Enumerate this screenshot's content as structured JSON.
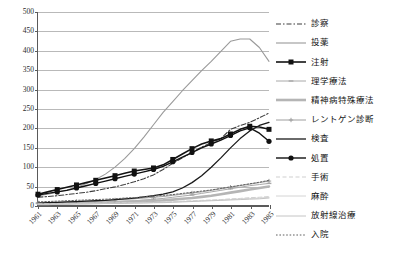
{
  "chart_data": {
    "type": "line",
    "title": "",
    "xlabel": "",
    "ylabel": "",
    "ylim": [
      0,
      500
    ],
    "ytick_step": 50,
    "grid": true,
    "legend_position": "right",
    "x": [
      1961,
      1962,
      1963,
      1964,
      1965,
      1966,
      1967,
      1968,
      1969,
      1970,
      1971,
      1972,
      1973,
      1974,
      1975,
      1976,
      1977,
      1978,
      1979,
      1980,
      1981,
      1982,
      1983,
      1984,
      1985
    ],
    "tick_labels": [
      "1961",
      "1963",
      "1965",
      "1967",
      "1969",
      "1971",
      "1973",
      "1975",
      "1977",
      "1979",
      "1981",
      "1983",
      "1985"
    ],
    "ytick_labels": [
      "0",
      "50",
      "100",
      "150",
      "200",
      "250",
      "300",
      "350",
      "400",
      "450",
      "500"
    ],
    "series": [
      {
        "name": "診察",
        "color": "#3d3d3d",
        "style": "dash-dot",
        "marker": "none",
        "width": 1.1,
        "values": [
          20,
          22,
          24,
          27,
          30,
          33,
          37,
          42,
          47,
          53,
          60,
          68,
          78,
          92,
          108,
          122,
          136,
          150,
          162,
          172,
          196,
          206,
          214,
          226,
          238
        ]
      },
      {
        "name": "投薬",
        "color": "#9a9a9a",
        "style": "solid",
        "marker": "none",
        "width": 1.1,
        "values": [
          24,
          28,
          33,
          39,
          46,
          55,
          66,
          80,
          98,
          120,
          146,
          176,
          208,
          240,
          268,
          296,
          322,
          348,
          372,
          398,
          424,
          430,
          430,
          408,
          372
        ]
      },
      {
        "name": "注射",
        "color": "#121212",
        "style": "solid",
        "marker": "square",
        "width": 1.6,
        "values": [
          28,
          34,
          40,
          46,
          52,
          58,
          64,
          70,
          76,
          82,
          88,
          92,
          96,
          104,
          118,
          132,
          146,
          158,
          166,
          172,
          184,
          196,
          204,
          202,
          196
        ]
      },
      {
        "name": "理学療法",
        "color": "#a8a8a8",
        "style": "solid",
        "marker": "dash",
        "width": 1.0,
        "values": [
          4,
          4,
          5,
          5,
          6,
          6,
          7,
          8,
          9,
          10,
          11,
          13,
          15,
          17,
          20,
          23,
          26,
          30,
          34,
          38,
          42,
          46,
          50,
          53,
          56
        ]
      },
      {
        "name": "精神病特殊療法",
        "color": "#b5b5b5",
        "style": "solid-thick",
        "marker": "none",
        "width": 2.6,
        "values": [
          3,
          3,
          4,
          4,
          5,
          5,
          6,
          6,
          7,
          8,
          9,
          10,
          11,
          12,
          14,
          16,
          18,
          21,
          24,
          28,
          32,
          36,
          40,
          44,
          48
        ]
      },
      {
        "name": "レントゲン診断",
        "color": "#9e9e9e",
        "style": "solid",
        "marker": "cross",
        "width": 1.0,
        "values": [
          6,
          6,
          7,
          8,
          9,
          10,
          11,
          12,
          13,
          15,
          16,
          18,
          20,
          22,
          25,
          28,
          31,
          34,
          38,
          42,
          46,
          50,
          54,
          58,
          62
        ]
      },
      {
        "name": "検査",
        "color": "#1a1a1a",
        "style": "solid",
        "marker": "none",
        "width": 1.3,
        "values": [
          5,
          6,
          7,
          8,
          9,
          10,
          11,
          12,
          14,
          16,
          18,
          21,
          24,
          28,
          34,
          44,
          58,
          76,
          98,
          122,
          148,
          172,
          192,
          206,
          214
        ]
      },
      {
        "name": "処置",
        "color": "#111111",
        "style": "solid",
        "marker": "circle",
        "width": 1.4,
        "values": [
          26,
          30,
          34,
          38,
          44,
          50,
          56,
          62,
          68,
          74,
          80,
          86,
          92,
          100,
          112,
          124,
          136,
          148,
          158,
          168,
          180,
          192,
          200,
          186,
          165
        ]
      },
      {
        "name": "手術",
        "color": "#cfcfcf",
        "style": "dashed",
        "marker": "none",
        "width": 1.0,
        "values": [
          3,
          3,
          3,
          4,
          4,
          4,
          5,
          5,
          5,
          6,
          6,
          7,
          7,
          8,
          9,
          10,
          11,
          12,
          13,
          14,
          16,
          17,
          19,
          20,
          22
        ]
      },
      {
        "name": "麻酔",
        "color": "#d4d4d4",
        "style": "solid",
        "marker": "none",
        "width": 1.0,
        "values": [
          2,
          2,
          2,
          3,
          3,
          3,
          4,
          4,
          4,
          5,
          5,
          6,
          6,
          7,
          8,
          9,
          10,
          11,
          12,
          13,
          14,
          16,
          17,
          18,
          20
        ]
      },
      {
        "name": "放射線治療",
        "color": "#c4c4c4",
        "style": "solid",
        "marker": "none",
        "width": 1.0,
        "values": [
          2,
          2,
          2,
          2,
          3,
          3,
          3,
          4,
          4,
          4,
          5,
          5,
          6,
          6,
          7,
          8,
          9,
          10,
          11,
          12,
          13,
          14,
          15,
          16,
          18
        ]
      },
      {
        "name": "入院",
        "color": "#5f5f5f",
        "style": "dotted",
        "marker": "none",
        "width": 1.0,
        "values": [
          8,
          9,
          10,
          11,
          12,
          13,
          14,
          15,
          16,
          18,
          19,
          21,
          23,
          25,
          27,
          30,
          33,
          36,
          39,
          43,
          47,
          51,
          55,
          59,
          64
        ]
      }
    ]
  },
  "legend": {
    "items": [
      {
        "label": "診察"
      },
      {
        "label": "投薬"
      },
      {
        "label": "注射"
      },
      {
        "label": "理学療法"
      },
      {
        "label": "精神病特殊療法"
      },
      {
        "label": "レントゲン診断"
      },
      {
        "label": "検査"
      },
      {
        "label": "処置"
      },
      {
        "label": "手術"
      },
      {
        "label": "麻酔"
      },
      {
        "label": "放射線治療"
      },
      {
        "label": "入院"
      }
    ]
  }
}
